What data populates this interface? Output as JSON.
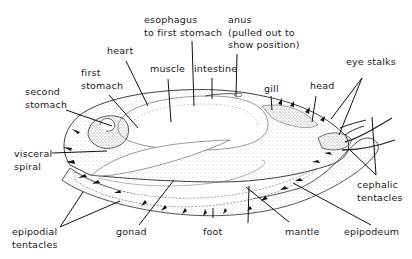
{
  "diagram": {
    "labels": {
      "esophagus": "esophagus\nto first stomach",
      "anus": "anus\n(pulled out to\nshow position)",
      "heart": "heart",
      "muscle": "muscle",
      "intestine": "intestine",
      "first_stomach": "first\nstomach",
      "second_stomach": "second\nstomach",
      "gill": "gill",
      "head": "head",
      "eye_stalks": "eye stalks",
      "visceral_spiral": "visceral\nspiral",
      "cephalic_tentacles": "cephalic\ntentacles",
      "epipodial_tentacles": "epipodial\ntentacles",
      "gonad": "gonad",
      "foot": "foot",
      "mantle": "mantle",
      "epipodeum": "epipodeum"
    },
    "colors": {
      "ink": "#1a1a1a",
      "stipple": "#9a9a9a",
      "background": "#ffffff"
    }
  }
}
